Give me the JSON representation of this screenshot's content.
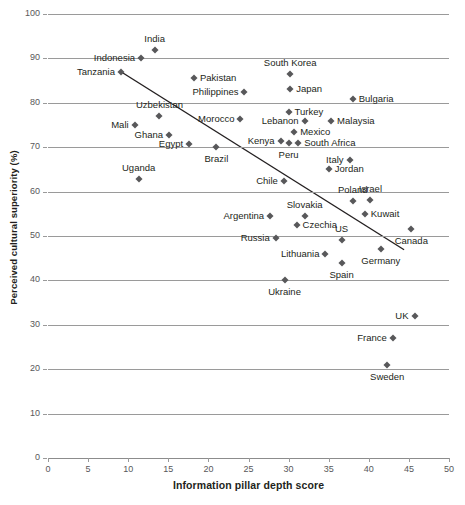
{
  "chart_data": {
    "type": "scatter",
    "title": "",
    "xlabel": "Information pillar depth score",
    "ylabel": "Perceived cultural superiority (%)",
    "xlim": [
      0,
      50
    ],
    "ylim": [
      0,
      100
    ],
    "xticks": [
      0,
      5,
      10,
      15,
      20,
      25,
      30,
      35,
      40,
      45,
      50
    ],
    "yticks": [
      0,
      10,
      20,
      30,
      40,
      50,
      60,
      70,
      80,
      90,
      100
    ],
    "grid": "horizontal",
    "legend": "none",
    "marker_color": "#58585a",
    "marker_shape": "diamond",
    "trendline": {
      "type": "linear",
      "color": "#231f20",
      "x_start": 9.1,
      "y_start": 87.0,
      "x_end": 44.4,
      "y_end": 46.9
    },
    "points": [
      {
        "label": "India",
        "x": 13.3,
        "y": 92.0,
        "label_pos": "above"
      },
      {
        "label": "Indonesia",
        "x": 11.6,
        "y": 90.0,
        "label_pos": "left"
      },
      {
        "label": "Tanzania",
        "x": 9.1,
        "y": 87.0,
        "label_pos": "left"
      },
      {
        "label": "Pakistan",
        "x": 18.2,
        "y": 85.5,
        "label_pos": "right"
      },
      {
        "label": "Philippines",
        "x": 24.5,
        "y": 82.5,
        "label_pos": "left"
      },
      {
        "label": "South Korea",
        "x": 30.2,
        "y": 86.5,
        "label_pos": "above"
      },
      {
        "label": "Japan",
        "x": 30.2,
        "y": 83.0,
        "label_pos": "right"
      },
      {
        "label": "Bulgaria",
        "x": 38.0,
        "y": 80.8,
        "label_pos": "right"
      },
      {
        "label": "Uzbekistan",
        "x": 13.9,
        "y": 77.0,
        "label_pos": "above"
      },
      {
        "label": "Morocco",
        "x": 24.0,
        "y": 76.4,
        "label_pos": "left"
      },
      {
        "label": "Turkey",
        "x": 30.0,
        "y": 78.0,
        "label_pos": "right"
      },
      {
        "label": "Lebanon",
        "x": 32.0,
        "y": 76.0,
        "label_pos": "left"
      },
      {
        "label": "Malaysia",
        "x": 35.3,
        "y": 76.0,
        "label_pos": "right"
      },
      {
        "label": "Mali",
        "x": 10.8,
        "y": 75.0,
        "label_pos": "left"
      },
      {
        "label": "Ghana",
        "x": 15.1,
        "y": 72.8,
        "label_pos": "left"
      },
      {
        "label": "Mexico",
        "x": 30.7,
        "y": 73.5,
        "label_pos": "right"
      },
      {
        "label": "Kenya",
        "x": 29.0,
        "y": 71.5,
        "label_pos": "left"
      },
      {
        "label": "Peru",
        "x": 30.0,
        "y": 71.0,
        "label_pos": "below"
      },
      {
        "label": "South Africa",
        "x": 31.2,
        "y": 71.0,
        "label_pos": "right"
      },
      {
        "label": "Egypt",
        "x": 17.6,
        "y": 70.8,
        "label_pos": "left"
      },
      {
        "label": "Brazil",
        "x": 21.0,
        "y": 70.0,
        "label_pos": "below"
      },
      {
        "label": "Italy",
        "x": 37.6,
        "y": 67.2,
        "label_pos": "left"
      },
      {
        "label": "Jordan",
        "x": 35.0,
        "y": 65.0,
        "label_pos": "right"
      },
      {
        "label": "Uganda",
        "x": 11.3,
        "y": 62.8,
        "label_pos": "above"
      },
      {
        "label": "Chile",
        "x": 29.4,
        "y": 62.5,
        "label_pos": "left"
      },
      {
        "label": "Poland",
        "x": 38.0,
        "y": 57.8,
        "label_pos": "above"
      },
      {
        "label": "Israel",
        "x": 40.2,
        "y": 58.0,
        "label_pos": "above"
      },
      {
        "label": "Kuwait",
        "x": 39.5,
        "y": 55.0,
        "label_pos": "right"
      },
      {
        "label": "Slovakia",
        "x": 32.0,
        "y": 54.5,
        "label_pos": "above"
      },
      {
        "label": "Argentina",
        "x": 27.7,
        "y": 54.6,
        "label_pos": "left"
      },
      {
        "label": "Czechia",
        "x": 31.0,
        "y": 52.5,
        "label_pos": "right"
      },
      {
        "label": "Canada",
        "x": 45.3,
        "y": 51.5,
        "label_pos": "below"
      },
      {
        "label": "Russia",
        "x": 28.4,
        "y": 49.5,
        "label_pos": "left"
      },
      {
        "label": "US",
        "x": 36.6,
        "y": 49.0,
        "label_pos": "above"
      },
      {
        "label": "Germany",
        "x": 41.5,
        "y": 47.0,
        "label_pos": "below"
      },
      {
        "label": "Lithuania",
        "x": 34.6,
        "y": 46.0,
        "label_pos": "left"
      },
      {
        "label": "Spain",
        "x": 36.6,
        "y": 44.0,
        "label_pos": "below"
      },
      {
        "label": "Ukraine",
        "x": 29.5,
        "y": 40.0,
        "label_pos": "below"
      },
      {
        "label": "UK",
        "x": 45.7,
        "y": 32.0,
        "label_pos": "left"
      },
      {
        "label": "France",
        "x": 43.0,
        "y": 27.0,
        "label_pos": "left"
      },
      {
        "label": "Sweden",
        "x": 42.3,
        "y": 21.0,
        "label_pos": "below"
      }
    ]
  }
}
